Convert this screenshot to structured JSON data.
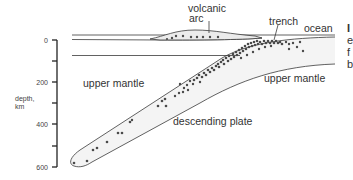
{
  "figure": {
    "type": "cross-section diagram"
  },
  "labels": {
    "volcanic_arc_line1": "volcanic",
    "volcanic_arc_line2": "arc",
    "trench": "trench",
    "ocean": "ocean",
    "upper_mantle_left": "upper mantle",
    "upper_mantle_right": "upper mantle",
    "descending_plate": "descending plate"
  },
  "axis": {
    "label_line1": "depth,",
    "label_line2": "km",
    "ticks": [
      "0",
      "200",
      "400",
      "600"
    ],
    "minor_ticks": [
      100,
      300,
      500
    ],
    "range": [
      0,
      600
    ],
    "direction": "down"
  },
  "cropped_edge_text": [
    "I",
    "e",
    "f",
    "b"
  ],
  "colors": {
    "line": "#3a3a3a",
    "dots": "#4a4a4a",
    "fill_slab": "#f2f2f2",
    "fill_arc": "#ececec",
    "text": "#333333"
  }
}
